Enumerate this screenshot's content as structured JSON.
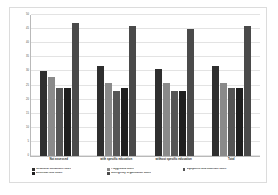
{
  "chart_data": {
    "type": "bar",
    "title": "",
    "subtitle": "",
    "xlabel": "",
    "ylabel": "",
    "ylim": [
      0,
      50
    ],
    "ytick_step": 5,
    "yticks": [
      "0",
      "5",
      "10",
      "15",
      "20",
      "25",
      "30",
      "35",
      "40",
      "45",
      "50"
    ],
    "grid": true,
    "legend_position": "bottom",
    "categories": [
      "Not assessed",
      "with specific education",
      "without specific education",
      "Total"
    ],
    "series": [
      {
        "name": "Structural Conditions score",
        "color": "#2f2f2f",
        "values": [
          30,
          32,
          31,
          32
        ]
      },
      {
        "name": "Playground score",
        "color": "#8a8a8a",
        "values": [
          28,
          26,
          26,
          26
        ]
      },
      {
        "name": "Equipment and materials score",
        "color": "#555555",
        "values": [
          24,
          23,
          23,
          24
        ]
      },
      {
        "name": "Electrical Risk Score",
        "color": "#1f1f1f",
        "values": [
          24,
          24,
          23,
          24
        ]
      },
      {
        "name": "Emergency Organization Score",
        "color": "#4a4a4a",
        "values": [
          47,
          46,
          45,
          46
        ]
      }
    ]
  }
}
